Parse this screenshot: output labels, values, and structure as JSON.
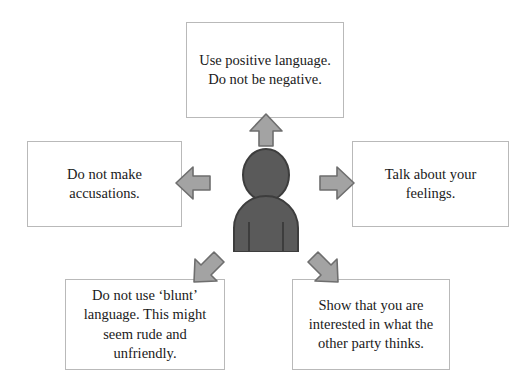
{
  "diagram": {
    "colors": {
      "background": "#ffffff",
      "box_border": "#b9b9b9",
      "text": "#1a1a1a",
      "arrow_fill": "#a3a3a3",
      "arrow_stroke": "#6e6e6e",
      "person_fill": "#5a5a5a",
      "person_stroke": "#3d3d3d"
    },
    "center": {
      "icon": "person-icon",
      "label": "person"
    },
    "boxes": [
      {
        "id": "top",
        "text": "Use positive language. Do not be negative.",
        "arrow": "arrow-up-icon"
      },
      {
        "id": "left",
        "text": "Do not make accusations.",
        "arrow": "arrow-left-icon"
      },
      {
        "id": "right",
        "text": "Talk about your feelings.",
        "arrow": "arrow-right-icon"
      },
      {
        "id": "bottom_left",
        "text": "Do not use ‘blunt’ language. This might seem rude and unfriendly.",
        "arrow": "arrow-down-left-icon"
      },
      {
        "id": "bottom_right",
        "text": "Show that you are interested in what the other party thinks.",
        "arrow": "arrow-down-right-icon"
      }
    ]
  }
}
